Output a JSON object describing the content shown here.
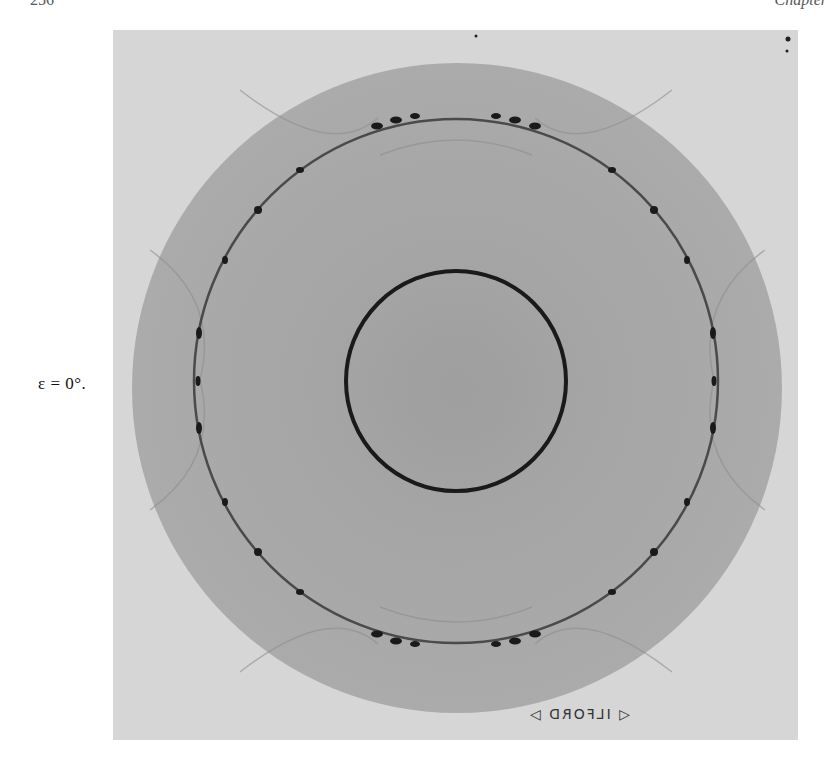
{
  "page_header": {
    "page_number": "256",
    "chapter_label": "Chapter"
  },
  "figure": {
    "label": "ε = 0°.",
    "film_maker_mark": "◁ ILFORD ▷",
    "colors": {
      "background_film": "#d6d6d6",
      "shadow_disc": "#a9a9a9",
      "inner_disc": "#a3a3a3",
      "ring": "#1a1a1a",
      "outer_ring": "#3a3a3a"
    },
    "geometry": {
      "photo": {
        "x": 113,
        "y": 30,
        "width": 685,
        "height": 710
      },
      "shadow_disc": {
        "cx": 457,
        "cy": 388,
        "r": 325,
        "clip_top_y": 58
      },
      "outer_ring": {
        "cx": 456,
        "cy": 381,
        "r": 262
      },
      "inner_ring": {
        "cx": 456,
        "cy": 381,
        "r": 110
      }
    }
  }
}
